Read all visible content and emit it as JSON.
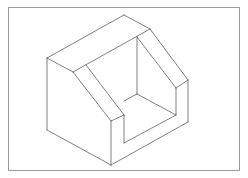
{
  "figure": {
    "type": "isometric-technical-drawing",
    "line_color": "#4a4a4a",
    "frame_color": "#9a9a9a",
    "background": "#ffffff"
  }
}
